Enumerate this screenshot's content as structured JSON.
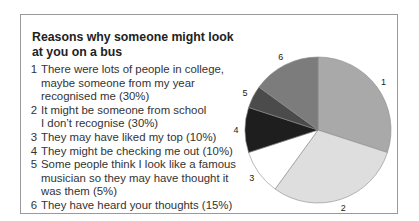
{
  "chart_data": {
    "type": "pie",
    "title": "Reasons why someone might look at you on a bus",
    "start_angle": "12 o'clock, clockwise",
    "categories": [
      "1",
      "2",
      "3",
      "4",
      "5",
      "6"
    ],
    "values": [
      30,
      30,
      10,
      10,
      5,
      15
    ],
    "legend": [
      {
        "num": "1",
        "text": "There were lots of people in college, maybe someone from my year recognised me (30%)"
      },
      {
        "num": "2",
        "text": "It might be someone from school I don’t recognise (30%)"
      },
      {
        "num": "3",
        "text": "They may have liked my top (10%)"
      },
      {
        "num": "4",
        "text": "They might be checking me out (10%)"
      },
      {
        "num": "5",
        "text": "Some people think I look like a famous musician so they may have thought it was them (5%)"
      },
      {
        "num": "6",
        "text": "They have heard your thoughts (15%)"
      }
    ],
    "colors": [
      "#a9a9a9",
      "#dedede",
      "#ffffff",
      "#1e1e1e",
      "#4b4b4b",
      "#7c7c7c"
    ]
  },
  "box": {
    "title": "Reasons why someone might look at you on a bus",
    "items": [
      {
        "num": "1",
        "line1": "There were lots of people in college,",
        "line2": "maybe someone from my year",
        "line3": "recognised me (30%)"
      },
      {
        "num": "2",
        "line1": "It might be someone from school",
        "line2": "I don’t recognise (30%)"
      },
      {
        "num": "3",
        "line1": "They may have liked my top (10%)"
      },
      {
        "num": "4",
        "line1": "They might be checking me out (10%)"
      },
      {
        "num": "5",
        "line1": "Some people think I look like a famous",
        "line2": "musician so they may have thought it",
        "line3": "was them (5%)"
      },
      {
        "num": "6",
        "line1": "They have heard your thoughts (15%)"
      }
    ]
  }
}
